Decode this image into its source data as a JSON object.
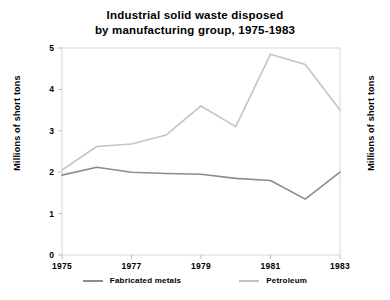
{
  "chart_data": {
    "type": "line",
    "title": "Industrial solid waste disposed\nby manufacturing group, 1975-1983",
    "xlabel": "",
    "ylabel": "Millions of short tons",
    "ylabel_right": "Millions of short tons",
    "xlim": [
      1975,
      1983
    ],
    "ylim": [
      0,
      5
    ],
    "yticks": [
      0,
      1,
      2,
      3,
      4,
      5
    ],
    "ytick_labels": [
      "0",
      "1",
      "2",
      "3",
      "4",
      "5"
    ],
    "xticks": [
      1975,
      1977,
      1979,
      1981,
      1983
    ],
    "xtick_labels": [
      "1975",
      "1977",
      "1979",
      "1981",
      "1983"
    ],
    "x": [
      1975,
      1976,
      1977,
      1978,
      1979,
      1980,
      1981,
      1982,
      1983
    ],
    "grid": false,
    "legend_position": "bottom",
    "series": [
      {
        "name": "Fabricated metals",
        "color": "#8c8c8c",
        "values": [
          1.93,
          2.12,
          2.0,
          1.97,
          1.95,
          1.85,
          1.8,
          1.35,
          2.0
        ]
      },
      {
        "name": "Petroleum",
        "color": "#c4c4c4",
        "values": [
          2.05,
          2.62,
          2.68,
          2.9,
          3.6,
          3.1,
          4.85,
          4.6,
          3.5
        ]
      }
    ],
    "annotations": []
  },
  "legend": {
    "items": [
      {
        "label": "Fabricated metals",
        "color": "#8c8c8c"
      },
      {
        "label": "Petroleum",
        "color": "#c4c4c4"
      }
    ]
  },
  "axes": {
    "left_title": "Millions of short tons",
    "right_title": "Millions of short tons"
  }
}
